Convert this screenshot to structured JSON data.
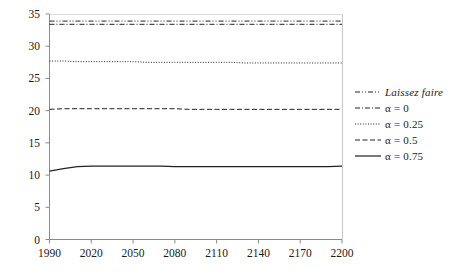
{
  "chart_data": {
    "type": "line",
    "title": "",
    "subtitle": "",
    "xlabel": "",
    "ylabel": "",
    "xlim": [
      1990,
      2200
    ],
    "ylim": [
      0,
      35
    ],
    "xticks": [
      1990,
      2020,
      2050,
      2080,
      2110,
      2140,
      2170,
      2200
    ],
    "yticks": [
      0,
      5,
      10,
      15,
      20,
      25,
      30,
      35
    ],
    "xtick_labels": [
      "1990",
      "2020",
      "2050",
      "2080",
      "2110",
      "2140",
      "2170",
      "2200"
    ],
    "ytick_labels": [
      "0",
      "5",
      "10",
      "15",
      "20",
      "25",
      "30",
      "35"
    ],
    "grid": false,
    "legend_position": "right",
    "x": [
      1990,
      2000,
      2010,
      2020,
      2030,
      2040,
      2050,
      2060,
      2070,
      2080,
      2090,
      2100,
      2110,
      2120,
      2130,
      2140,
      2150,
      2160,
      2170,
      2180,
      2190,
      2200
    ],
    "series": [
      {
        "name": "Laissez faire",
        "style": "dashdotdot",
        "color": "#222222",
        "italic": true,
        "values": [
          33.9,
          33.9,
          33.9,
          33.9,
          33.9,
          33.9,
          33.9,
          33.9,
          33.9,
          33.9,
          33.9,
          33.9,
          33.9,
          33.9,
          33.9,
          33.9,
          33.9,
          33.9,
          33.9,
          33.9,
          33.9,
          33.9
        ]
      },
      {
        "name": "α = 0",
        "style": "dashdot",
        "color": "#222222",
        "italic": false,
        "values": [
          33.4,
          33.4,
          33.4,
          33.4,
          33.4,
          33.4,
          33.4,
          33.4,
          33.4,
          33.4,
          33.4,
          33.4,
          33.4,
          33.4,
          33.4,
          33.4,
          33.4,
          33.4,
          33.4,
          33.4,
          33.4,
          33.4
        ]
      },
      {
        "name": "α = 0.25",
        "style": "dotted",
        "color": "#222222",
        "italic": false,
        "values": [
          27.7,
          27.7,
          27.6,
          27.6,
          27.6,
          27.6,
          27.6,
          27.5,
          27.5,
          27.5,
          27.5,
          27.5,
          27.5,
          27.5,
          27.4,
          27.4,
          27.4,
          27.4,
          27.4,
          27.4,
          27.4,
          27.4
        ]
      },
      {
        "name": "α = 0.5",
        "style": "dashed",
        "color": "#222222",
        "italic": false,
        "values": [
          20.2,
          20.3,
          20.3,
          20.3,
          20.3,
          20.3,
          20.3,
          20.3,
          20.3,
          20.3,
          20.2,
          20.2,
          20.2,
          20.2,
          20.2,
          20.2,
          20.2,
          20.2,
          20.2,
          20.2,
          20.2,
          20.2
        ]
      },
      {
        "name": "α = 0.75",
        "style": "solid",
        "color": "#222222",
        "italic": false,
        "values": [
          10.6,
          11.0,
          11.3,
          11.4,
          11.4,
          11.4,
          11.4,
          11.4,
          11.4,
          11.3,
          11.3,
          11.3,
          11.3,
          11.3,
          11.3,
          11.3,
          11.3,
          11.3,
          11.3,
          11.3,
          11.3,
          11.4
        ]
      }
    ]
  },
  "legend": {
    "entries": [
      {
        "label": "Laissez faire"
      },
      {
        "label": "α = 0"
      },
      {
        "label": "α = 0.25"
      },
      {
        "label": "α = 0.5"
      },
      {
        "label": "α = 0.75"
      }
    ]
  },
  "axes": {
    "y_labels": [
      "35",
      "30",
      "25",
      "20",
      "15",
      "10",
      "5",
      "0"
    ],
    "x_labels": [
      "1990",
      "2020",
      "2050",
      "2080",
      "2110",
      "2140",
      "2170",
      "2200"
    ]
  }
}
